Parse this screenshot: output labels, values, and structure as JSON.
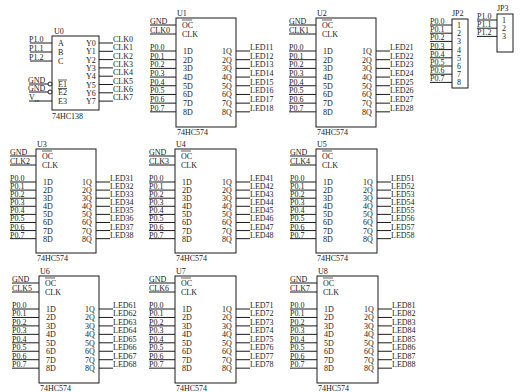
{
  "decoder": {
    "ref": "U0",
    "part": "74HC138",
    "inputs": [
      {
        "pin": "A",
        "net": "P1.0"
      },
      {
        "pin": "B",
        "net": "P1.1"
      },
      {
        "pin": "C",
        "net": "P1.2"
      }
    ],
    "enables": [
      {
        "pin": "E1",
        "net": "GND",
        "inverted": true
      },
      {
        "pin": "E2",
        "net": "GND",
        "inverted": true
      },
      {
        "pin": "E3",
        "net": "Vcc",
        "inverted": false
      }
    ],
    "outputs": [
      {
        "pin": "Y0",
        "net": "CLK0"
      },
      {
        "pin": "Y1",
        "net": "CLK1"
      },
      {
        "pin": "Y2",
        "net": "CLK2"
      },
      {
        "pin": "Y3",
        "net": "CLK3"
      },
      {
        "pin": "Y4",
        "net": "CLK4"
      },
      {
        "pin": "Y5",
        "net": "CLK5"
      },
      {
        "pin": "Y6",
        "net": "CLK6"
      },
      {
        "pin": "Y7",
        "net": "CLK7"
      }
    ],
    "vcc_label": "V",
    "vcc_sub": "cc"
  },
  "latch_pins": {
    "oc": "OC",
    "clk": "CLK",
    "d": [
      "1D",
      "2D",
      "3D",
      "4D",
      "5D",
      "6D",
      "7D",
      "8D"
    ],
    "q": [
      "1Q",
      "2Q",
      "3Q",
      "4Q",
      "5Q",
      "6Q",
      "7Q",
      "8Q"
    ],
    "d_nets": [
      "P0.0",
      "P0.1",
      "P0.2",
      "P0.3",
      "P0.4",
      "P0.5",
      "P0.6",
      "P0.7"
    ],
    "oc_net": "GND"
  },
  "latches": [
    {
      "ref": "U1",
      "part": "74HC574",
      "clk_net": "CLK0",
      "outputs": [
        "LED11",
        "LED12",
        "LED13",
        "LED14",
        "LED15",
        "LED16",
        "LED17",
        "LED18"
      ]
    },
    {
      "ref": "U2",
      "part": "74HC574",
      "clk_net": "CLK1",
      "outputs": [
        "LED21",
        "LED22",
        "LED23",
        "LED24",
        "LED25",
        "LED26",
        "LED27",
        "LED28"
      ]
    },
    {
      "ref": "U3",
      "part": "74HC574",
      "clk_net": "CLK2",
      "outputs": [
        "LED31",
        "LED32",
        "LED33",
        "LED34",
        "LED35",
        "LED36",
        "LED37",
        "LED38"
      ]
    },
    {
      "ref": "U4",
      "part": "74HC574",
      "clk_net": "CLK3",
      "outputs": [
        "LED41",
        "LED42",
        "LED43",
        "LED44",
        "LED45",
        "LED46",
        "LED47",
        "LED48"
      ]
    },
    {
      "ref": "U5",
      "part": "74HC574",
      "clk_net": "CLK4",
      "outputs": [
        "LED51",
        "LED52",
        "LED53",
        "LED54",
        "LED55",
        "LED56",
        "LED57",
        "LED58"
      ]
    },
    {
      "ref": "U6",
      "part": "74HC574",
      "clk_net": "CLK5",
      "outputs": [
        "LED61",
        "LED62",
        "LED63",
        "LED64",
        "LED65",
        "LED66",
        "LED67",
        "LED68"
      ]
    },
    {
      "ref": "U7",
      "part": "74HC574",
      "clk_net": "CLK6",
      "outputs": [
        "LED71",
        "LED72",
        "LED73",
        "LED74",
        "LED75",
        "LED76",
        "LED77",
        "LED78"
      ]
    },
    {
      "ref": "U8",
      "part": "74HC574",
      "clk_net": "CLK7",
      "outputs": [
        "LED81",
        "LED82",
        "LED83",
        "LED84",
        "LED85",
        "LED86",
        "LED87",
        "LED88"
      ]
    }
  ],
  "connectors": [
    {
      "ref": "JP2",
      "pins": [
        "1",
        "2",
        "3",
        "4",
        "5",
        "6",
        "7",
        "8"
      ],
      "nets": [
        "P0.0",
        "P0.1",
        "P0.2",
        "P0.3",
        "P0.4",
        "P0.5",
        "P0.6",
        "P0.7"
      ]
    },
    {
      "ref": "JP3",
      "pins": [
        "1",
        "2",
        "3"
      ],
      "nets": [
        "P1.0",
        "P1.1",
        "P1.2"
      ]
    }
  ]
}
